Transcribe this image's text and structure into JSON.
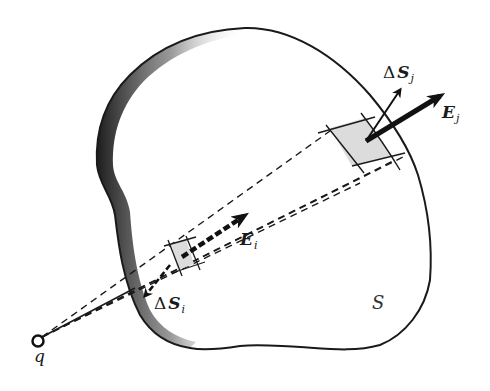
{
  "figure": {
    "type": "gauss-law-flux-diagram",
    "colors": {
      "outline": "#1a1a1a",
      "patch_fill": "#dcdcdc",
      "shade": "#2a2a2a",
      "background": "#ffffff"
    },
    "surface": {
      "label": "S"
    },
    "charge": {
      "label": "q"
    },
    "patch_i": {
      "area_label": {
        "delta": "Δ",
        "symbol": "S",
        "sub": "i"
      },
      "field_label": {
        "symbol": "E",
        "sub": "i"
      }
    },
    "patch_j": {
      "area_label": {
        "delta": "Δ",
        "symbol": "S",
        "sub": "j"
      },
      "field_label": {
        "symbol": "E",
        "sub": "j"
      }
    }
  }
}
